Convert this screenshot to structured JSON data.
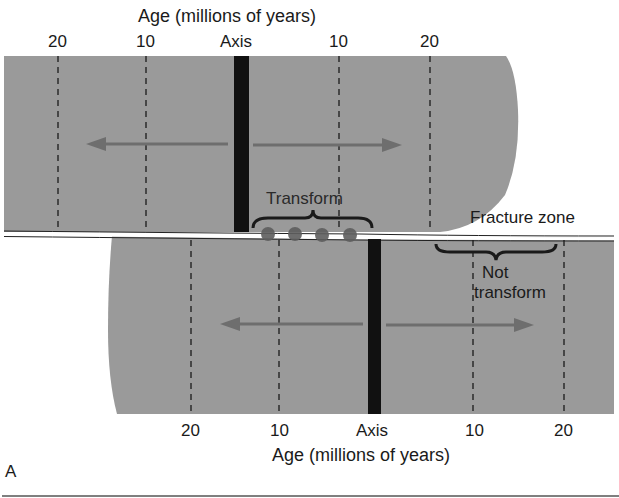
{
  "figure": {
    "panel_label": "A",
    "top_axis": {
      "title": "Age (millions of years)",
      "ticks": [
        "20",
        "10",
        "Axis",
        "10",
        "20"
      ]
    },
    "bottom_axis": {
      "title": "Age (millions of years)",
      "ticks": [
        "20",
        "10",
        "Axis",
        "10",
        "20"
      ]
    },
    "labels": {
      "transform": "Transform",
      "fracture_zone": "Fracture zone",
      "not_transform_line1": "Not",
      "not_transform_line2": "transform"
    },
    "colors": {
      "plate_fill": "#9a9a9a",
      "axis_bar": "#111111",
      "arrow": "#6e6e6e",
      "dots": "#5e5e5e",
      "fault_line": "#ffffff"
    }
  }
}
